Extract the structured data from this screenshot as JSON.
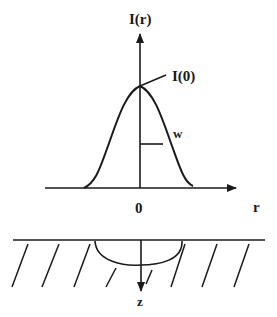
{
  "diagram": {
    "type": "gaussian-beam-profile",
    "colors": {
      "stroke": "#1a1a1a",
      "background": "#ffffff"
    },
    "labels": {
      "y_axis": "I(r)",
      "peak": "I(0)",
      "width": "w",
      "origin": "0",
      "x_axis": "r",
      "depth_axis": "z"
    },
    "parts": [
      "intensity-profile-plot",
      "material-surface-cross-section"
    ]
  }
}
